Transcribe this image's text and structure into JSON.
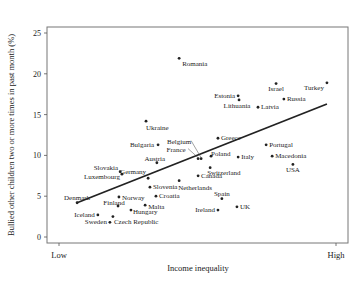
{
  "chart_data": {
    "type": "scatter",
    "title": "",
    "xlabel": "Income inequality",
    "ylabel": "Bullied other children two or more times in past month (%)",
    "x_tick_labels": [
      "Low",
      "High"
    ],
    "y_ticks": [
      0,
      5,
      10,
      15,
      20,
      25
    ],
    "ylim": [
      0,
      25
    ],
    "xlim": [
      0,
      100
    ],
    "grid": false,
    "legend": null,
    "trend_line": {
      "x": [
        10,
        93
      ],
      "y": [
        4.2,
        16.3
      ]
    },
    "points": [
      {
        "label": "Romania",
        "x": 43.9,
        "y": 21.9,
        "lx": 3,
        "ly": 8,
        "anchor": "start"
      },
      {
        "label": "Estonia",
        "x": 63.5,
        "y": 17.3,
        "lx": -3,
        "ly": 2,
        "anchor": "end"
      },
      {
        "label": "Lithuania",
        "x": 63.8,
        "y": 16.8,
        "lx": -2,
        "ly": 8,
        "anchor": "middle"
      },
      {
        "label": "Israel",
        "x": 76.1,
        "y": 18.8,
        "lx": 0,
        "ly": 7,
        "anchor": "middle"
      },
      {
        "label": "Turkey",
        "x": 93.0,
        "y": 18.9,
        "lx": -3,
        "ly": 7,
        "anchor": "end"
      },
      {
        "label": "Russia",
        "x": 78.7,
        "y": 16.9,
        "lx": 3,
        "ly": 2,
        "anchor": "start"
      },
      {
        "label": "Latvia",
        "x": 70.1,
        "y": 15.9,
        "lx": 3,
        "ly": 2,
        "anchor": "start"
      },
      {
        "label": "Ukraine",
        "x": 32.9,
        "y": 14.2,
        "lx": 0,
        "ly": 9,
        "anchor": "start"
      },
      {
        "label": "Bulgaria",
        "x": 36.9,
        "y": 11.3,
        "lx": -4,
        "ly": 2,
        "anchor": "end"
      },
      {
        "label": "Greece",
        "x": 56.8,
        "y": 12.1,
        "lx": 3,
        "ly": 2,
        "anchor": "start"
      },
      {
        "label": "Belgium",
        "x": 51.2,
        "y": 9.6,
        "lx": -22,
        "ly": -15,
        "anchor": "middle"
      },
      {
        "label": "France",
        "x": 50.2,
        "y": 9.6,
        "lx": -22,
        "ly": -7,
        "anchor": "middle"
      },
      {
        "label": "Poland",
        "x": 54.5,
        "y": 9.9,
        "lx": 0,
        "ly": 0,
        "anchor": "start"
      },
      {
        "label": "Italy",
        "x": 63.5,
        "y": 9.8,
        "lx": 3,
        "ly": 2,
        "anchor": "start"
      },
      {
        "label": "Switzerland",
        "x": 54.2,
        "y": 8.5,
        "lx": -3,
        "ly": 7,
        "anchor": "start"
      },
      {
        "label": "Canada",
        "x": 50.2,
        "y": 7.5,
        "lx": 3,
        "ly": 2,
        "anchor": "start"
      },
      {
        "label": "Portugal",
        "x": 72.8,
        "y": 11.3,
        "lx": 3,
        "ly": 2,
        "anchor": "start"
      },
      {
        "label": "Macedonia",
        "x": 74.8,
        "y": 9.9,
        "lx": 3,
        "ly": 2,
        "anchor": "start"
      },
      {
        "label": "USA",
        "x": 81.7,
        "y": 8.9,
        "lx": 0,
        "ly": 8,
        "anchor": "middle"
      },
      {
        "label": "Austria",
        "x": 36.5,
        "y": 9.1,
        "lx": -2,
        "ly": -2,
        "anchor": "middle"
      },
      {
        "label": "Germany",
        "x": 33.6,
        "y": 7.2,
        "lx": -2,
        "ly": -4,
        "anchor": "end"
      },
      {
        "label": "Slovakia",
        "x": 24.3,
        "y": 8.0,
        "lx": -2,
        "ly": -2,
        "anchor": "end"
      },
      {
        "label": "Luxembourg",
        "x": 24.9,
        "y": 7.7,
        "lx": -2,
        "ly": 5,
        "anchor": "end"
      },
      {
        "label": "Slovenia",
        "x": 34.2,
        "y": 6.1,
        "lx": 3,
        "ly": 2,
        "anchor": "start"
      },
      {
        "label": "Netherlands",
        "x": 43.9,
        "y": 6.9,
        "lx": -1,
        "ly": 9,
        "anchor": "start"
      },
      {
        "label": "Denmark",
        "x": 10.0,
        "y": 4.2,
        "lx": 0,
        "ly": -3,
        "anchor": "middle"
      },
      {
        "label": "Norway",
        "x": 23.9,
        "y": 4.9,
        "lx": 3,
        "ly": 3,
        "anchor": "start"
      },
      {
        "label": "Croatia",
        "x": 36.2,
        "y": 5.0,
        "lx": 3,
        "ly": 2,
        "anchor": "start"
      },
      {
        "label": "Finland",
        "x": 23.6,
        "y": 3.8,
        "lx": -4,
        "ly": -1,
        "anchor": "middle"
      },
      {
        "label": "Malta",
        "x": 32.6,
        "y": 3.9,
        "lx": 3,
        "ly": 4,
        "anchor": "start"
      },
      {
        "label": "Hungary",
        "x": 27.9,
        "y": 3.3,
        "lx": 2,
        "ly": 4,
        "anchor": "start"
      },
      {
        "label": "Iceland",
        "x": 16.9,
        "y": 2.7,
        "lx": -3,
        "ly": 2,
        "anchor": "end"
      },
      {
        "label": "Sweden",
        "x": 20.9,
        "y": 1.8,
        "lx": -3,
        "ly": 2,
        "anchor": "end"
      },
      {
        "label": "Czech Republic",
        "x": 21.9,
        "y": 2.5,
        "lx": 1,
        "ly": 7,
        "anchor": "start"
      },
      {
        "label": "Ireland",
        "x": 56.8,
        "y": 3.3,
        "lx": -3,
        "ly": 2,
        "anchor": "end"
      },
      {
        "label": "Spain",
        "x": 58.1,
        "y": 4.7,
        "lx": 0,
        "ly": -3,
        "anchor": "middle"
      },
      {
        "label": "UK",
        "x": 63.1,
        "y": 3.7,
        "lx": 3,
        "ly": 2,
        "anchor": "start"
      }
    ],
    "colors": {
      "points": "#222222",
      "line": "#222222",
      "axis": "#555555",
      "frame": "#777777"
    }
  }
}
